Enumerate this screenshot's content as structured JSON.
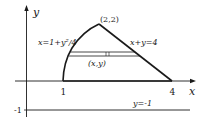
{
  "diagram": {
    "axes": {
      "x_label": "x",
      "y_label": "y",
      "x_ticks": [
        "1",
        "4"
      ],
      "y_ticks": [
        "-1"
      ]
    },
    "region": {
      "left_curve_label": "x=1+y²/4",
      "right_line_label": "x+y=4",
      "apex_label": "(2,2)",
      "strip_point_label": "(x,y)"
    },
    "lower_line_label": "y=-1",
    "colors": {
      "ink": "#1a1a1a",
      "background": "#ffffff"
    }
  }
}
